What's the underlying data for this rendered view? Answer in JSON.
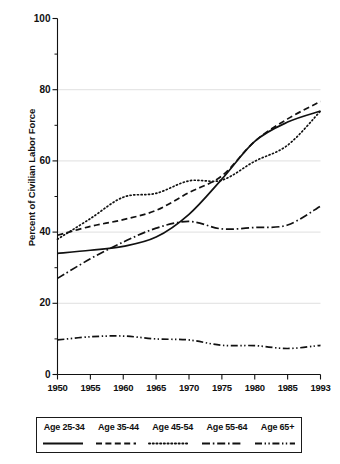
{
  "chart_data": {
    "type": "line",
    "title": "",
    "xlabel": "",
    "ylabel": "Percent of Civilian Labor Force",
    "xlim": [
      1950,
      1993
    ],
    "ylim": [
      0,
      100
    ],
    "grid": true,
    "grid_values": [
      20,
      40,
      60,
      80
    ],
    "legend_position": "below",
    "x": [
      1950,
      1955,
      1960,
      1965,
      1970,
      1975,
      1980,
      1985,
      1993
    ],
    "xtick_labels": [
      "1950",
      "1955",
      "1960",
      "1965",
      "1970",
      "1975",
      "1980",
      "1985",
      "1993"
    ],
    "ytick_labels": [
      "0",
      "20",
      "40",
      "60",
      "80",
      "100"
    ],
    "ytick_values": [
      0,
      20,
      40,
      60,
      80,
      100
    ],
    "yminor_values": [
      10,
      30,
      50,
      70,
      90
    ],
    "series": [
      {
        "name": "Age 25-34",
        "style": "solid",
        "values": [
          34.0,
          34.9,
          36.0,
          38.6,
          45.0,
          54.9,
          65.5,
          70.9,
          74.0
        ]
      },
      {
        "name": "Age 35-44",
        "style": "dashed",
        "values": [
          39.1,
          41.6,
          43.5,
          46.1,
          51.1,
          55.8,
          65.5,
          71.8,
          76.7
        ]
      },
      {
        "name": "Age 45-54",
        "style": "dotted",
        "values": [
          38.0,
          43.8,
          49.8,
          50.9,
          54.4,
          54.6,
          59.9,
          64.4,
          74.0
        ]
      },
      {
        "name": "Age 55-64",
        "style": "dashdot",
        "values": [
          27.0,
          32.5,
          37.2,
          41.1,
          43.0,
          40.9,
          41.3,
          42.0,
          47.3
        ]
      },
      {
        "name": "Age 65+",
        "style": "dashdotdot",
        "values": [
          9.7,
          10.6,
          10.8,
          10.0,
          9.7,
          8.2,
          8.1,
          7.3,
          8.2
        ]
      }
    ]
  },
  "axes": {
    "ylabel": "Percent of Civilian Labor Force"
  },
  "legend": {
    "items": [
      {
        "label": "Age 25-34",
        "style": "solid"
      },
      {
        "label": "Age 35-44",
        "style": "dashed"
      },
      {
        "label": "Age 45-54",
        "style": "dotted"
      },
      {
        "label": "Age 55-64",
        "style": "dashdot"
      },
      {
        "label": "Age 65+",
        "style": "dashdotdot"
      }
    ]
  }
}
